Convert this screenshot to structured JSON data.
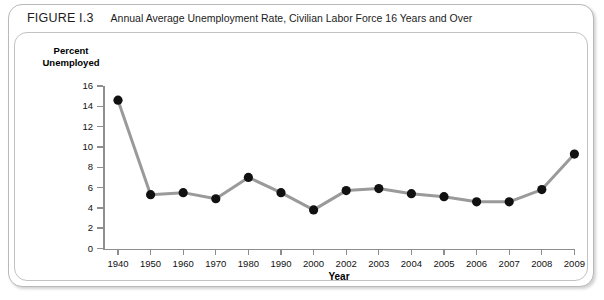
{
  "figure": {
    "label": "FIGURE I.3",
    "title": "Annual Average Unemployment Rate, Civilian Labor Force 16 Years and Over"
  },
  "chart_data": {
    "type": "line",
    "title": "Annual Average Unemployment Rate, Civilian Labor Force 16 Years and Over",
    "xlabel": "Year",
    "ylabel": "Percent Unemployed",
    "categories": [
      "1940",
      "1950",
      "1960",
      "1970",
      "1980",
      "1990",
      "2000",
      "2002",
      "2003",
      "2004",
      "2005",
      "2006",
      "2007",
      "2008",
      "2009"
    ],
    "values": [
      14.6,
      5.3,
      5.5,
      4.9,
      7.0,
      5.5,
      3.8,
      5.7,
      5.9,
      5.4,
      5.1,
      4.6,
      4.6,
      5.8,
      9.3
    ],
    "ylim": [
      0,
      16
    ],
    "yticks": [
      0,
      2,
      4,
      6,
      8,
      10,
      12,
      14,
      16
    ],
    "grid": false,
    "legend": false,
    "line_color": "#9a9a9a",
    "marker_color": "#111111",
    "axis_color": "#8e8e8e"
  }
}
